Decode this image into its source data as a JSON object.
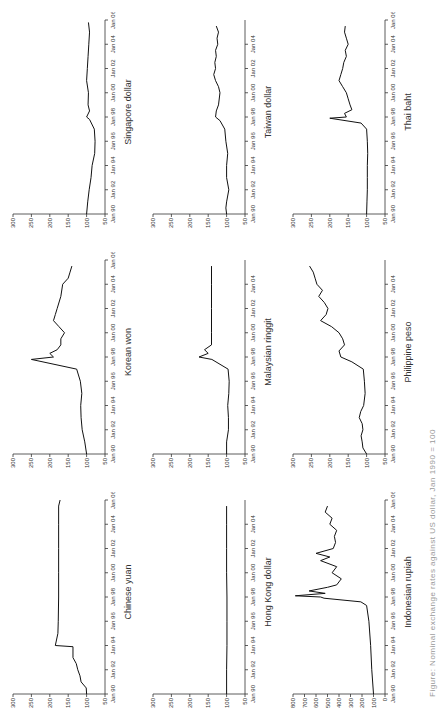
{
  "figure": {
    "caption": "Figure: Nominal exchange rates against US dollar, Jan 1990 = 100"
  },
  "chart_data": [
    {
      "type": "line",
      "title": "Chinese yuan",
      "ylim": [
        50,
        300
      ],
      "yticks": [
        50,
        100,
        150,
        200,
        250,
        300
      ],
      "xticks": [
        "Jan 90",
        "Jan 92",
        "Jan 94",
        "Jan 96",
        "Jan 98",
        "Jan 00",
        "Jan 02",
        "Jan 04",
        "Jan 06"
      ],
      "x": [
        1990,
        1990.5,
        1991,
        1991.5,
        1992,
        1992.5,
        1993,
        1993.9,
        1994,
        1995,
        1996,
        1998,
        2000,
        2002,
        2004,
        2005.5,
        2006
      ],
      "values": [
        100,
        101,
        115,
        118,
        124,
        128,
        137,
        137,
        185,
        178,
        177,
        176,
        176,
        176,
        176,
        176,
        172
      ]
    },
    {
      "type": "line",
      "title": "Hong Kong dollar",
      "ylim": [
        50,
        300
      ],
      "yticks": [
        50,
        100,
        150,
        200,
        250,
        300
      ],
      "xticks": [
        "Jan 90",
        "Jan 92",
        "Jan 94",
        "Jan 96",
        "Jan 98",
        "Jan 00",
        "Jan 02",
        "Jan 04"
      ],
      "x": [
        1990,
        1992,
        1994,
        1996,
        1998,
        2000,
        2002,
        2004,
        2005.5
      ],
      "values": [
        100,
        100,
        99,
        99,
        99,
        100,
        100,
        100,
        100
      ]
    },
    {
      "type": "line",
      "title": "Indonesian rupiah",
      "ylim": [
        0,
        800
      ],
      "yticks": [
        0,
        100,
        200,
        300,
        400,
        500,
        600,
        700,
        800
      ],
      "xticks": [
        "Jan 90",
        "Jan 92",
        "Jan 94",
        "Jan 96",
        "Jan 98",
        "Jan 00",
        "Jan 02",
        "Jan 04",
        "Jan 06"
      ],
      "x": [
        1990,
        1992,
        1994,
        1996,
        1997.3,
        1997.6,
        1997.9,
        1998,
        1998.1,
        1998.3,
        1998.5,
        1998.8,
        1999,
        1999.5,
        2000,
        2000.5,
        2001,
        2001.3,
        2001.6,
        2002,
        2002.5,
        2003,
        2003.5,
        2004,
        2004.5,
        2005,
        2005.5
      ],
      "values": [
        100,
        115,
        125,
        140,
        160,
        210,
        530,
        560,
        780,
        520,
        660,
        500,
        420,
        380,
        460,
        420,
        560,
        480,
        600,
        450,
        430,
        440,
        420,
        480,
        460,
        520,
        500
      ]
    },
    {
      "type": "line",
      "title": "Korean won",
      "ylim": [
        50,
        300
      ],
      "yticks": [
        50,
        100,
        150,
        200,
        250,
        300
      ],
      "xticks": [
        "Jan 90",
        "Jan 92",
        "Jan 94",
        "Jan 96",
        "Jan 98",
        "Jan 00",
        "Jan 02",
        "Jan 04",
        "Jan 06"
      ],
      "x": [
        1990,
        1991,
        1992,
        1993,
        1994,
        1995,
        1996,
        1997,
        1997.8,
        1998,
        1998.3,
        1998.6,
        1999,
        1999.5,
        2000,
        2000.5,
        2001,
        2001.5,
        2002,
        2003,
        2004,
        2004.5,
        2005,
        2005.5
      ],
      "values": [
        100,
        105,
        112,
        115,
        116,
        113,
        117,
        127,
        250,
        190,
        200,
        180,
        170,
        170,
        160,
        175,
        190,
        185,
        180,
        170,
        165,
        150,
        145,
        140
      ]
    },
    {
      "type": "line",
      "title": "Malaysian ringgit",
      "ylim": [
        50,
        300
      ],
      "yticks": [
        50,
        100,
        150,
        200,
        250,
        300
      ],
      "xticks": [
        "Jan 90",
        "Jan 92",
        "Jan 94",
        "Jan 96",
        "Jan 98",
        "Jan 00",
        "Jan 02",
        "Jan 04"
      ],
      "x": [
        1990,
        1991,
        1992,
        1993,
        1994,
        1995,
        1996,
        1997,
        1997.8,
        1998,
        1998.3,
        1998.6,
        1999,
        2000,
        2002,
        2004,
        2005.5
      ],
      "values": [
        100,
        100,
        95,
        95,
        97,
        94,
        93,
        96,
        140,
        175,
        150,
        160,
        141,
        141,
        141,
        141,
        141
      ]
    },
    {
      "type": "line",
      "title": "Philippine peso",
      "ylim": [
        50,
        300
      ],
      "yticks": [
        50,
        100,
        150,
        200,
        250,
        300
      ],
      "xticks": [
        "Jan 90",
        "Jan 92",
        "Jan 94",
        "Jan 96",
        "Jan 98",
        "Jan 00",
        "Jan 02",
        "Jan 04"
      ],
      "x": [
        1990,
        1990.5,
        1991,
        1991.5,
        1992,
        1992.5,
        1993,
        1993.5,
        1994,
        1995,
        1996,
        1997,
        1997.6,
        1998,
        1998.5,
        1999,
        1999.5,
        2000,
        2000.5,
        2001,
        2001.5,
        2002,
        2002.5,
        2003,
        2003.5,
        2004,
        2004.5,
        2005,
        2005.5
      ],
      "values": [
        100,
        110,
        112,
        115,
        110,
        112,
        120,
        116,
        108,
        104,
        106,
        109,
        140,
        170,
        175,
        160,
        165,
        175,
        195,
        225,
        210,
        205,
        215,
        230,
        220,
        235,
        240,
        245,
        255
      ]
    },
    {
      "type": "line",
      "title": "Singapore dollar",
      "ylim": [
        50,
        300
      ],
      "yticks": [
        50,
        100,
        150,
        200,
        250,
        300
      ],
      "xticks": [
        "Jan 90",
        "Jan 92",
        "Jan 94",
        "Jan 96",
        "Jan 98",
        "Jan 00",
        "Jan 02",
        "Jan 04",
        "Jan 06"
      ],
      "x": [
        1990,
        1991,
        1992,
        1993,
        1994,
        1995,
        1996,
        1997,
        1997.8,
        1998,
        1998.5,
        1999,
        2000,
        2001,
        2002,
        2003,
        2004,
        2005,
        2005.8
      ],
      "values": [
        100,
        97,
        93,
        88,
        85,
        78,
        77,
        79,
        92,
        100,
        92,
        96,
        95,
        100,
        98,
        96,
        94,
        92,
        95
      ]
    },
    {
      "type": "line",
      "title": "Taiwan dollar",
      "ylim": [
        50,
        300
      ],
      "yticks": [
        50,
        100,
        150,
        200,
        250,
        300
      ],
      "xticks": [
        "Jan 90",
        "Jan 92",
        "Jan 94",
        "Jan 96",
        "Jan 98",
        "Jan 00",
        "Jan 02",
        "Jan 04"
      ],
      "x": [
        1990,
        1990.5,
        1991,
        1992,
        1993,
        1994,
        1995,
        1996,
        1997,
        1997.7,
        1998,
        1998.5,
        1999,
        2000,
        2000.5,
        2001,
        2001.5,
        2002,
        2002.5,
        2003,
        2003.5,
        2004,
        2004.5,
        2005,
        2005.5
      ],
      "values": [
        100,
        102,
        100,
        94,
        100,
        100,
        97,
        102,
        105,
        118,
        130,
        128,
        122,
        118,
        122,
        130,
        135,
        130,
        132,
        128,
        130,
        124,
        126,
        122,
        128
      ]
    },
    {
      "type": "line",
      "title": "Thai baht",
      "ylim": [
        50,
        300
      ],
      "yticks": [
        50,
        100,
        150,
        200,
        250,
        300
      ],
      "xticks": [
        "Jan 90",
        "Jan 92",
        "Jan 94",
        "Jan 96",
        "Jan 98",
        "Jan 00",
        "Jan 02",
        "Jan 04",
        "Jan 06"
      ],
      "x": [
        1990,
        1991,
        1992,
        1993,
        1994,
        1995,
        1996,
        1997,
        1997.5,
        1997.9,
        1998,
        1998.3,
        1998.6,
        1999,
        1999.5,
        2000,
        2000.5,
        2001,
        2001.5,
        2002,
        2002.5,
        2003,
        2003.5,
        2004,
        2004.5,
        2005,
        2005.5
      ],
      "values": [
        100,
        99,
        98,
        98,
        98,
        97,
        98,
        100,
        115,
        200,
        155,
        160,
        140,
        145,
        150,
        155,
        165,
        175,
        170,
        165,
        162,
        155,
        158,
        150,
        155,
        160,
        158
      ]
    }
  ]
}
